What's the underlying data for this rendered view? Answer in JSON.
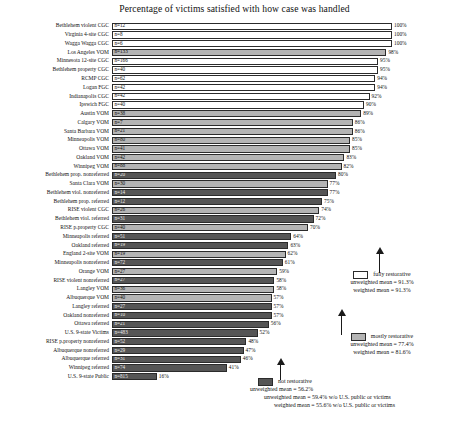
{
  "chart_data": {
    "type": "bar",
    "orientation": "horizontal",
    "title": "Percentage of victims satisfied with how case was handled",
    "xlabel": "",
    "ylabel": "",
    "xlim": [
      0,
      100
    ],
    "grid": false,
    "legend_position": "right",
    "value_suffix": "%",
    "categories": [
      "Bethlehem violent CGC",
      "Virginia 4-site CGC",
      "Wagga Wagga CGC",
      "Los Angeles VOM",
      "Minnesota 12-site CGC",
      "Bethlehem property CGC",
      "RCMP CGC",
      "Logan FGC",
      "Indianapolis CGC",
      "Ipswich FGC",
      "Austin VOM",
      "Calgary VOM",
      "Santa Barbara VOM",
      "Minneapolis VOM",
      "Ottawa VOM",
      "Oakland VOM",
      "Winnipeg VOM",
      "Bethlehem prop. nonreferred",
      "Santa Clara VOM",
      "Bethlehem viol. nonreferred",
      "Bethlehem prop. referred",
      "RISE violent CGC",
      "Bethlehem viol. referred",
      "RISE p.property CGC",
      "Minneapolis referred",
      "Oakland referred",
      "England 2-site VOM",
      "Minneapolis nonreferred",
      "Orange VOM",
      "RISE violent nonreferred",
      "Langley VOM",
      "Albuquerque VOM",
      "Langley referred",
      "Oakland nonreferred",
      "Ottawa referred",
      "U.S. 9-state Victims",
      "RISE p.property nonreferred",
      "Albuquerque nonreferred",
      "Albuquerque referred",
      "Winnipeg referred",
      "U.S. 9-state Public"
    ],
    "values": [
      100,
      100,
      100,
      98,
      95,
      95,
      94,
      94,
      92,
      90,
      89,
      86,
      86,
      85,
      85,
      83,
      82,
      80,
      77,
      77,
      75,
      74,
      72,
      70,
      64,
      63,
      62,
      61,
      59,
      58,
      58,
      57,
      57,
      57,
      56,
      52,
      48,
      47,
      46,
      41,
      16
    ],
    "n_labels": [
      "n=12",
      "n=8",
      "n=6",
      "n=133",
      "n=166",
      "n=40",
      "n=62",
      "n=42",
      "n=42",
      "n=40",
      "n=38",
      "n=7",
      "n=21",
      "n=80",
      "n=41",
      "n=42",
      "n=88",
      "n=20",
      "n=30",
      "n=14",
      "n=12",
      "n=26",
      "n=31",
      "n=40",
      "n=51",
      "n=19",
      "n=19",
      "n=72",
      "n=27",
      "n=27",
      "n=36",
      "n=40",
      "n=27",
      "n=10",
      "n=21",
      "n=483",
      "n=52",
      "n=29",
      "n=31",
      "n=74",
      "n=815"
    ],
    "pct_labels": [
      "100%",
      "100%",
      "100%",
      "98%",
      "95%",
      "95%",
      "94%",
      "94%",
      "92%",
      "90%",
      "89%",
      "86%",
      "86%",
      "85%",
      "85%",
      "83%",
      "82%",
      "80%",
      "77%",
      "77%",
      "75%",
      "74%",
      "72%",
      "70%",
      "64%",
      "63%",
      "62%",
      "61%",
      "59%",
      "58%",
      "58%",
      "57%",
      "57%",
      "57%",
      "56%",
      "52%",
      "48%",
      "47%",
      "46%",
      "41%",
      "16%"
    ],
    "series_groups": [
      "fully",
      "fully",
      "fully",
      "mostly",
      "fully",
      "fully",
      "fully",
      "fully",
      "fully",
      "fully",
      "mostly",
      "mostly",
      "mostly",
      "mostly",
      "mostly",
      "mostly",
      "mostly",
      "not",
      "mostly",
      "not",
      "not",
      "mostly",
      "not",
      "mostly",
      "not",
      "not",
      "mostly",
      "not",
      "mostly",
      "not",
      "mostly",
      "mostly",
      "not",
      "not",
      "not",
      "not",
      "not",
      "not",
      "not",
      "not",
      "not"
    ],
    "colors": {
      "fully": "#ffffff",
      "mostly": "#b4b4b4",
      "not": "#555555",
      "bar_outline": "#2b2b2b"
    }
  },
  "legend": {
    "fully": {
      "label": "fully restorative",
      "unweighted": "unweighted mean = 91.3%",
      "weighted": "weighted mean = 91.3%"
    },
    "mostly": {
      "label": "mostly restorative",
      "unweighted": "unweighted mean = 77.4%",
      "weighted": "weighted mean = 81.6%"
    },
    "not": {
      "label": "not restorative",
      "unweighted": "unweighted mean = 56.2%",
      "unweighted_excl": "unweighted mean = 59.4% w/o U.S. public or victims",
      "weighted_excl": "weighted mean = 55.6% w/o U.S. public or victims"
    }
  }
}
